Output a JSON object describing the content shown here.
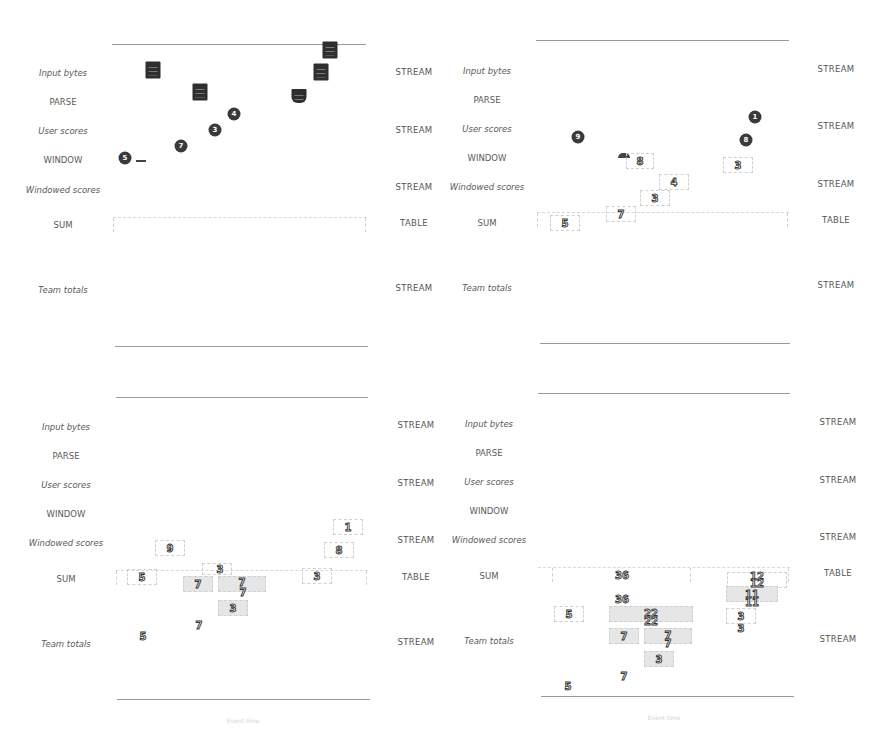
{
  "rows": [
    {
      "label": "Input bytes",
      "italic": true,
      "kind": "STREAM"
    },
    {
      "label": "PARSE",
      "italic": false,
      "kind": ""
    },
    {
      "label": "User scores",
      "italic": true,
      "kind": "STREAM"
    },
    {
      "label": "WINDOW",
      "italic": false,
      "kind": ""
    },
    {
      "label": "Windowed scores",
      "italic": true,
      "kind": "STREAM"
    },
    {
      "label": "SUM",
      "italic": false,
      "kind": "TABLE"
    },
    {
      "label": "Team totals",
      "italic": true,
      "kind": "STREAM"
    }
  ],
  "panels": [
    {
      "id": "panel-1",
      "axis_title": "",
      "dots": [
        {
          "value": "5",
          "x": 125,
          "y": 156
        },
        {
          "value": "7",
          "x": 181,
          "y": 146
        },
        {
          "value": "3",
          "x": 215,
          "y": 130
        },
        {
          "value": "4",
          "x": 234,
          "y": 114
        }
      ],
      "chips": [
        {
          "x": 153,
          "y": 70,
          "tab": false
        },
        {
          "x": 200,
          "y": 92,
          "tab": false
        },
        {
          "x": 330,
          "y": 50,
          "tab": false
        },
        {
          "x": 321,
          "y": 72,
          "tab": false
        },
        {
          "x": 299,
          "y": 96,
          "tab": true
        }
      ]
    },
    {
      "id": "panel-2",
      "axis_title": "",
      "dots": [
        {
          "value": "9",
          "x": 578,
          "y": 137
        },
        {
          "value": "1",
          "x": 755,
          "y": 117
        },
        {
          "value": "8",
          "x": 746,
          "y": 140
        }
      ],
      "boxes": [
        {
          "value": "8",
          "x": 640,
          "y": 160,
          "w": 26,
          "h": 14,
          "shaded": false
        },
        {
          "value": "3",
          "x": 738,
          "y": 165,
          "w": 28,
          "h": 14,
          "shaded": false
        },
        {
          "value": "4",
          "x": 674,
          "y": 182,
          "w": 28,
          "h": 14,
          "shaded": false
        },
        {
          "value": "3",
          "x": 655,
          "y": 198,
          "w": 28,
          "h": 14,
          "shaded": false
        },
        {
          "value": "7",
          "x": 621,
          "y": 214,
          "w": 28,
          "h": 14,
          "shaded": false
        },
        {
          "value": "5",
          "x": 565,
          "y": 223,
          "w": 28,
          "h": 14,
          "shaded": false
        }
      ]
    },
    {
      "id": "panel-3",
      "axis_title": "Event time",
      "boxes": [
        {
          "value": "1",
          "x": 348,
          "y": 527,
          "w": 28,
          "h": 14,
          "shaded": false
        },
        {
          "value": "9",
          "x": 170,
          "y": 548,
          "w": 28,
          "h": 14,
          "shaded": false
        },
        {
          "value": "8",
          "x": 339,
          "y": 550,
          "w": 28,
          "h": 14,
          "shaded": false
        },
        {
          "value": "3",
          "x": 217,
          "y": 569,
          "w": 28,
          "h": 10,
          "shaded": false
        },
        {
          "value": "5",
          "x": 142,
          "y": 577,
          "w": 28,
          "h": 14,
          "shaded": false
        },
        {
          "value": "3",
          "x": 317,
          "y": 576,
          "w": 28,
          "h": 14,
          "shaded": false
        },
        {
          "value": "7",
          "x": 198,
          "y": 584,
          "w": 28,
          "h": 14,
          "shaded": true
        },
        {
          "value": "7",
          "x": 242,
          "y": 584,
          "w": 46,
          "h": 14,
          "shaded": true
        },
        {
          "value": "3",
          "x": 233,
          "y": 608,
          "w": 28,
          "h": 14,
          "shaded": true
        }
      ],
      "labels": [
        {
          "value": "7",
          "x": 243,
          "y": 592
        },
        {
          "value": "7",
          "x": 199,
          "y": 625
        },
        {
          "value": "5",
          "x": 143,
          "y": 636
        }
      ]
    },
    {
      "id": "panel-4",
      "axis_title": "Event time",
      "boxes": [
        {
          "value": "12",
          "x": 757,
          "y": 576,
          "w": 58,
          "h": 14,
          "shaded": false
        },
        {
          "value": "11",
          "x": 752,
          "y": 594,
          "w": 50,
          "h": 14,
          "shaded": true
        },
        {
          "value": "5",
          "x": 569,
          "y": 614,
          "w": 28,
          "h": 14,
          "shaded": false
        },
        {
          "value": "22",
          "x": 651,
          "y": 614,
          "w": 82,
          "h": 14,
          "shaded": true
        },
        {
          "value": "3",
          "x": 741,
          "y": 616,
          "w": 28,
          "h": 14,
          "shaded": false
        },
        {
          "value": "7",
          "x": 624,
          "y": 636,
          "w": 28,
          "h": 14,
          "shaded": true
        },
        {
          "value": "7",
          "x": 668,
          "y": 636,
          "w": 46,
          "h": 14,
          "shaded": true
        },
        {
          "value": "3",
          "x": 659,
          "y": 659,
          "w": 28,
          "h": 14,
          "shaded": true
        }
      ],
      "labels": [
        {
          "value": "36",
          "x": 622,
          "y": 575
        },
        {
          "value": "12",
          "x": 757,
          "y": 582
        },
        {
          "value": "36",
          "x": 622,
          "y": 599
        },
        {
          "value": "11",
          "x": 752,
          "y": 601
        },
        {
          "value": "22",
          "x": 651,
          "y": 621
        },
        {
          "value": "3",
          "x": 741,
          "y": 628
        },
        {
          "value": "7",
          "x": 668,
          "y": 643
        },
        {
          "value": "7",
          "x": 624,
          "y": 676
        },
        {
          "value": "5",
          "x": 568,
          "y": 686
        }
      ]
    }
  ],
  "colors": {
    "marker_dark": "#3a3a3a",
    "box_shade": "#e6e6e6",
    "label_text": "#555555",
    "axis_line": "#9a9a9a"
  }
}
